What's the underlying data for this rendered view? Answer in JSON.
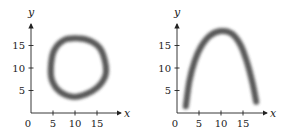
{
  "chart_data": [
    {
      "type": "line",
      "title": "",
      "xlabel": "x",
      "ylabel": "y",
      "xlim": [
        0,
        19
      ],
      "ylim": [
        0,
        20
      ],
      "xticks": [
        0,
        5,
        10,
        15
      ],
      "yticks": [
        5,
        10,
        15
      ],
      "grid": false,
      "legend": null,
      "description": "Closed blurry ring (roughly circular) centered near (10.5, 10)",
      "series": [
        {
          "name": "ring",
          "x": [
            4.5,
            5.2,
            7.5,
            10.5,
            13.5,
            15.8,
            17.0,
            16.8,
            15.0,
            12.5,
            9.5,
            6.5,
            4.8,
            4.5
          ],
          "y": [
            10.0,
            13.8,
            16.2,
            16.6,
            16.0,
            14.2,
            10.5,
            8.0,
            5.6,
            4.2,
            3.6,
            4.8,
            7.2,
            10.0
          ]
        }
      ]
    },
    {
      "type": "line",
      "title": "",
      "xlabel": "x",
      "ylabel": "y",
      "xlim": [
        0,
        19
      ],
      "ylim": [
        0,
        20
      ],
      "xticks": [
        0,
        5,
        10,
        15
      ],
      "yticks": [
        5,
        10,
        15
      ],
      "grid": false,
      "legend": null,
      "description": "Blurry downward-opening arch peaking near (10, 18)",
      "series": [
        {
          "name": "arch",
          "x": [
            2.0,
            2.8,
            4.0,
            5.5,
            7.5,
            10.0,
            12.5,
            14.5,
            16.0,
            17.2,
            18.0
          ],
          "y": [
            1.5,
            7.0,
            11.5,
            14.8,
            17.2,
            18.2,
            17.6,
            15.0,
            11.0,
            6.5,
            2.5
          ]
        }
      ]
    }
  ],
  "labels": {
    "x_axis": "x",
    "y_axis": "y",
    "x_ticks": [
      "0",
      "5",
      "10",
      "15"
    ],
    "y_ticks": [
      "5",
      "10",
      "15"
    ]
  },
  "colors": {
    "axis": "#222222",
    "curve": "#3a3a3a",
    "background": "#ffffff"
  }
}
